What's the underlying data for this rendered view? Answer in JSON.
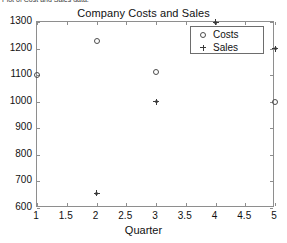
{
  "caption": "Plot of Cost and Sales data.",
  "xaxis_label": "Quarter",
  "legend": {
    "entries": [
      {
        "label": "Costs",
        "marker": "circle-marker"
      },
      {
        "label": "Sales",
        "marker": "plus-marker"
      }
    ]
  },
  "chart_data": {
    "type": "scatter",
    "title": "Company Costs and Sales",
    "xlabel": "Quarter",
    "ylabel": "",
    "xlim": [
      1,
      5
    ],
    "ylim": [
      600,
      1300
    ],
    "xticks": [
      "1",
      "1.5",
      "2",
      "2.5",
      "3",
      "3.5",
      "4",
      "4.5",
      "5"
    ],
    "xtick_values": [
      1,
      1.5,
      2,
      2.5,
      3,
      3.5,
      4,
      4.5,
      5
    ],
    "yticks": [
      "600",
      "700",
      "800",
      "900",
      "1000",
      "1100",
      "1200",
      "1300"
    ],
    "ytick_values": [
      600,
      700,
      800,
      900,
      1000,
      1100,
      1200,
      1300
    ],
    "grid": false,
    "legend_position": "upper right (inside axes)",
    "series": [
      {
        "name": "Costs",
        "marker": "circle",
        "color": "#4c4c4c",
        "x": [
          1,
          2,
          3,
          4,
          5
        ],
        "values": [
          1100,
          1230,
          1110,
          1200,
          1000
        ]
      },
      {
        "name": "Sales",
        "marker": "plus",
        "color": "#3a3a3a",
        "x": [
          2,
          3,
          4,
          5
        ],
        "values": [
          655,
          1000,
          1300,
          1200
        ]
      }
    ]
  }
}
